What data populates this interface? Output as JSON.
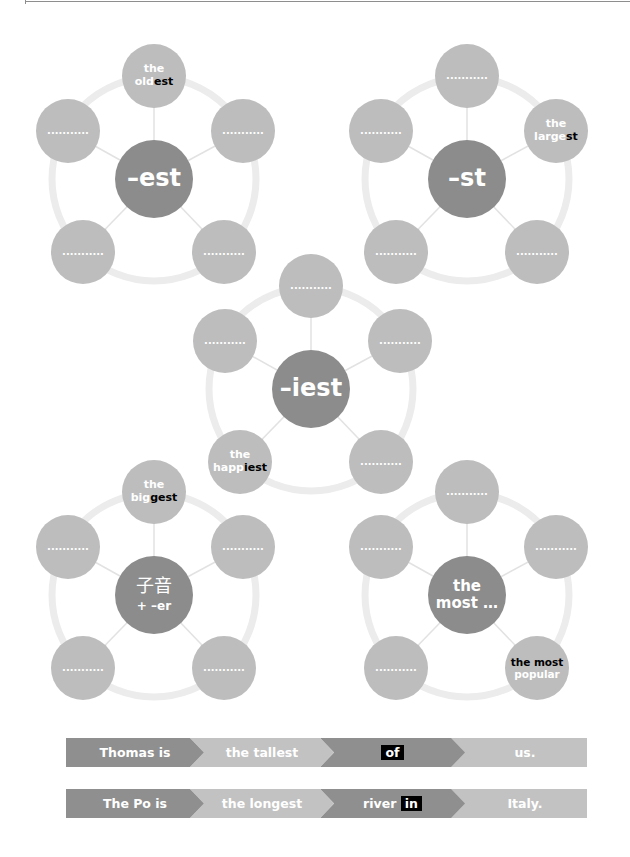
{
  "colors": {
    "hub": "#8c8c8c",
    "satellite": "#bdbdbd",
    "ring": "#ececec",
    "spoke": "#e2e2e2",
    "banner_dark": "#8f8f8f",
    "banner_light": "#c2c2c2",
    "highlight": "#000000"
  },
  "blank": "...........",
  "diagrams": [
    {
      "hub": "–est",
      "example": {
        "position": "top",
        "pre": "the",
        "stem": "old",
        "suffix": "est"
      }
    },
    {
      "hub": "–st",
      "example": {
        "position": "upper-right",
        "pre": "the",
        "stem": "large",
        "suffix": "st"
      }
    },
    {
      "hub": "–iest",
      "example": {
        "position": "lower-left",
        "pre": "the",
        "stem": "happ",
        "suffix": "iest"
      }
    },
    {
      "hub_line1": "子音",
      "hub_line2": "+ –er",
      "example": {
        "position": "top",
        "pre": "the",
        "stem": "big",
        "suffix": "gest"
      }
    },
    {
      "hub_line1": "the",
      "hub_line2": "most …",
      "example": {
        "position": "lower-right",
        "line1": "the most",
        "line2": "popular"
      }
    }
  ],
  "sentences": [
    {
      "subject": "Thomas is",
      "superlative": "the tallest",
      "pre": "",
      "preposition": "of",
      "end": "us."
    },
    {
      "subject": "The Po is",
      "superlative": "the longest",
      "pre": "river",
      "preposition": "in",
      "end": "Italy."
    }
  ]
}
